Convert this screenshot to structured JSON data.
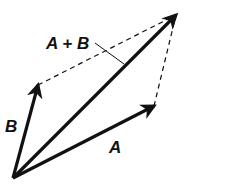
{
  "diagram": {
    "labels": {
      "sum": "A + B",
      "a": "A",
      "b": "B"
    },
    "points": {
      "origin": [
        13,
        178
      ],
      "a_tip": [
        154,
        106
      ],
      "b_tip": [
        38,
        85
      ],
      "sum_tip": [
        176,
        15
      ]
    },
    "colors": {
      "stroke": "#111111",
      "background": "#ffffff"
    }
  }
}
